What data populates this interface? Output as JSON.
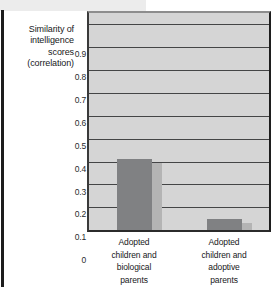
{
  "figure": {
    "name": "adoption-intelligence-correlation-bar-chart"
  },
  "chart_data": {
    "type": "bar",
    "title": "",
    "subtitle": "",
    "xlabel": "",
    "ylabel": "Similarity of intelligence scores (correlation)",
    "ylabel_lines": [
      "Similarity of",
      "intelligence",
      "scores",
      "(correlation)"
    ],
    "categories": [
      "Adopted children and biological parents",
      "Adopted children and adoptive parents"
    ],
    "category_lines": [
      [
        "Adopted",
        "children and",
        "biological",
        "parents"
      ],
      [
        "Adopted",
        "children and",
        "adoptive",
        "parents"
      ]
    ],
    "values": [
      0.31,
      0.05
    ],
    "ylim": [
      0,
      0.95
    ],
    "ytick_values": [
      0.9,
      0.8,
      0.7,
      0.6,
      0.5,
      0.4,
      0.3,
      0.2,
      0.1,
      0
    ],
    "ytick_labels": [
      "0.9",
      "0.8",
      "0.7",
      "0.6",
      "0.5",
      "0.4",
      "0.3",
      "0.2",
      "0.1",
      "0"
    ],
    "grid": true,
    "grid_axis": "y",
    "legend": false,
    "legend_position": "none",
    "colors": {
      "bar": "#808183",
      "bar_shadow": "#b4b4b4",
      "plot_background": "#d5d5d5",
      "gridline": "#444546",
      "axis": "#1e1e1e",
      "text": "#17181a",
      "page_background": "#ffffff",
      "page_rule": "#1c1c1c",
      "page_band": "#ececec"
    }
  }
}
